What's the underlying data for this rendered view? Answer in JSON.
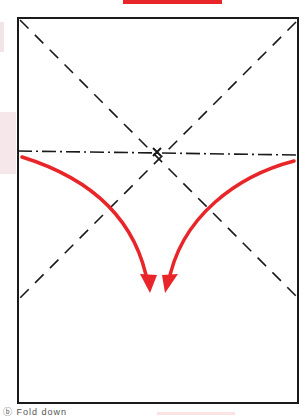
{
  "diagram": {
    "type": "origami-fold-step",
    "paper": {
      "shape": "rectangle",
      "x": 18,
      "y": 18,
      "width": 280,
      "height": 385,
      "stroke": "#1a1a1a"
    },
    "lines": [
      {
        "name": "valley-diagonal-1",
        "style": "dashed",
        "from": [
          20,
          20
        ],
        "to": [
          296,
          296
        ]
      },
      {
        "name": "valley-diagonal-2",
        "style": "dashed",
        "from": [
          296,
          22
        ],
        "to": [
          20,
          298
        ]
      },
      {
        "name": "mountain-horizontal",
        "style": "dash-dot",
        "from": [
          18,
          151
        ],
        "to": [
          298,
          155
        ]
      }
    ],
    "intersection_mark": {
      "x": 157,
      "y": 152,
      "symbol": "x"
    },
    "arrows": [
      {
        "name": "fold-arrow-left",
        "color": "#e8262a",
        "from": [
          22,
          156
        ],
        "to": [
          150,
          290
        ],
        "direction": "down-right"
      },
      {
        "name": "fold-arrow-right",
        "color": "#e8262a",
        "from": [
          295,
          160
        ],
        "to": [
          165,
          290
        ],
        "direction": "down-left"
      }
    ],
    "accent_color": "#e8262a"
  },
  "caption": {
    "text": "ⓑ Fold down"
  }
}
